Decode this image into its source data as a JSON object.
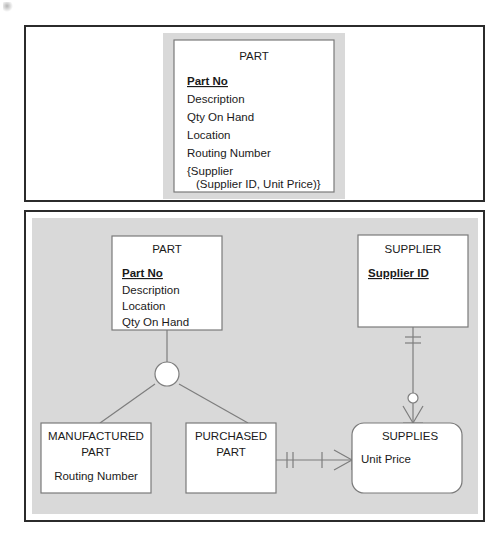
{
  "figure": {
    "type": "diagram",
    "notation": "crows-foot-ER",
    "panels": [
      {
        "id": "top",
        "label": "unnormalized-relation-panel"
      },
      {
        "id": "bottom",
        "label": "er-model-panel"
      }
    ]
  },
  "colors": {
    "panel_border": "#2b2b2b",
    "panel_fill": "#ffffff",
    "shade": "#d9d9d9",
    "entity_fill": "#ffffff",
    "entity_stroke": "#7a7a7a",
    "connector": "#7d7d7d",
    "text": "#1a1a1a"
  },
  "top_panel": {
    "entity": {
      "name": "PART",
      "primary_key": "Part No",
      "attributes": [
        "Description",
        "Qty On Hand",
        "Location",
        "Routing Number",
        "{Supplier",
        "(Supplier ID, Unit Price)}"
      ]
    }
  },
  "bottom_panel": {
    "entities": [
      {
        "id": "part",
        "name": "PART",
        "shape": "rectangle",
        "primary_key": "Part No",
        "attributes": [
          "Description",
          "Location",
          "Qty On Hand"
        ]
      },
      {
        "id": "supplier",
        "name": "SUPPLIER",
        "shape": "rectangle",
        "primary_key": "Supplier ID",
        "attributes": []
      },
      {
        "id": "manufactured_part",
        "name": "MANUFACTURED PART",
        "name_line1": "MANUFACTURED",
        "name_line2": "PART",
        "shape": "rectangle",
        "primary_key": "",
        "attributes": [
          "Routing Number"
        ]
      },
      {
        "id": "purchased_part",
        "name": "PURCHASED PART",
        "name_line1": "PURCHASED",
        "name_line2": "PART",
        "shape": "rectangle",
        "primary_key": "",
        "attributes": []
      },
      {
        "id": "supplies",
        "name": "SUPPLIES",
        "shape": "rounded-rectangle",
        "primary_key": "",
        "attributes": [
          "Unit Price"
        ]
      }
    ],
    "relationships": [
      {
        "id": "part-subtypes",
        "type": "supertype-subtype",
        "from": "part",
        "to": [
          "manufactured_part",
          "purchased_part"
        ],
        "symbol": "empty-circle-discriminator"
      },
      {
        "id": "purchased-supplies",
        "type": "association",
        "from": "purchased_part",
        "to": "supplies",
        "from_cardinality": "one-and-only-one",
        "to_cardinality": "one-or-many"
      },
      {
        "id": "supplier-supplies",
        "type": "association",
        "from": "supplier",
        "to": "supplies",
        "from_cardinality": "one-and-only-one",
        "to_cardinality": "zero-or-many"
      }
    ]
  }
}
